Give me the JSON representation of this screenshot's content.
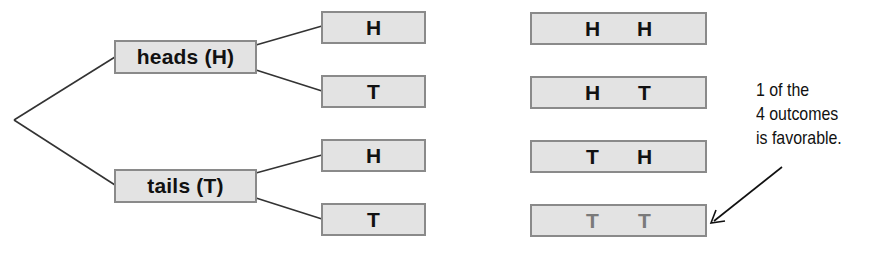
{
  "diagram": {
    "type": "probability-tree",
    "root": {
      "label": ""
    },
    "first_toss": [
      {
        "label": "heads (H)",
        "children": [
          "H",
          "T"
        ]
      },
      {
        "label": "tails (T)",
        "children": [
          "H",
          "T"
        ]
      }
    ],
    "outcomes": [
      {
        "first": "H",
        "second": "H",
        "favorable": false
      },
      {
        "first": "H",
        "second": "T",
        "favorable": false
      },
      {
        "first": "T",
        "second": "H",
        "favorable": false
      },
      {
        "first": "T",
        "second": "T",
        "favorable": true
      }
    ],
    "annotation": {
      "lines": [
        "1 of the",
        "4 outcomes",
        "is favorable."
      ],
      "points_to": "outcome T T"
    },
    "colors": {
      "box_fill": "#e3e3e3",
      "box_border": "#8a8a8a",
      "text": "#111111",
      "favorable_text": "#7a7a7a",
      "line": "#333333"
    }
  }
}
